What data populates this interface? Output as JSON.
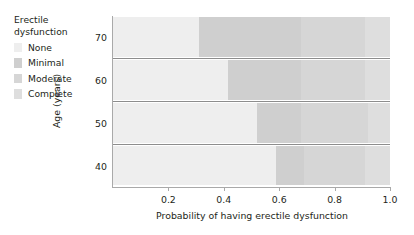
{
  "chart_data": {
    "type": "bar",
    "orientation": "horizontal",
    "stacked": true,
    "title": "",
    "xlabel": "Probability of having erectile dysfunction",
    "ylabel": "Age (years)",
    "xlim": [
      0,
      1
    ],
    "xticks": [
      0.2,
      0.4,
      0.6,
      0.8,
      1.0
    ],
    "xtick_labels": [
      "0.2",
      "0.4",
      "0.6",
      "0.8",
      "1.0"
    ],
    "categories": [
      "70",
      "60",
      "50",
      "40"
    ],
    "category_order_top_to_bottom": [
      "70",
      "60",
      "50",
      "40"
    ],
    "grid": false,
    "legend_title": "Erectile\ndysfunction",
    "legend_position": "upper-left-outside",
    "series": [
      {
        "name": "None",
        "color": "#eeeeee",
        "values": [
          0.31,
          0.415,
          0.52,
          0.59
        ]
      },
      {
        "name": "Minimal",
        "color": "#cfcfcf",
        "values": [
          0.37,
          0.265,
          0.16,
          0.1
        ]
      },
      {
        "name": "Moderate",
        "color": "#d6d6d6",
        "values": [
          0.23,
          0.23,
          0.24,
          0.22
        ]
      },
      {
        "name": "Complete",
        "color": "#dedede",
        "values": [
          0.09,
          0.09,
          0.08,
          0.09
        ]
      }
    ]
  },
  "legend": {
    "title": "Erectile\ndysfunction",
    "items": [
      {
        "label": "None",
        "color": "#eeeeee"
      },
      {
        "label": "Minimal",
        "color": "#cfcfcf"
      },
      {
        "label": "Moderate",
        "color": "#d6d6d6"
      },
      {
        "label": "Complete",
        "color": "#dedede"
      }
    ]
  },
  "axes": {
    "x_title": "Probability of having erectile dysfunction",
    "y_title": "Age (years)",
    "x_tick_labels": [
      "0.2",
      "0.4",
      "0.6",
      "0.8",
      "1.0"
    ],
    "y_tick_labels": [
      "70",
      "60",
      "50",
      "40"
    ]
  }
}
